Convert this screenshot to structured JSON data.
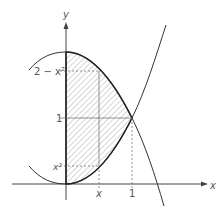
{
  "figure": {
    "axes": {
      "x_label": "x",
      "y_label": "y"
    },
    "curves": [
      {
        "name": "upper",
        "equation": "y = 2 - x^2"
      },
      {
        "name": "lower",
        "equation": "y = x^2"
      }
    ],
    "labels": {
      "y_upper": "2 − x²",
      "y_one": "1",
      "y_lower": "x²",
      "x_var": "x",
      "x_one": "1"
    },
    "colors": {
      "line": "#333333",
      "hatch": "#888888",
      "label": "#555555"
    }
  }
}
